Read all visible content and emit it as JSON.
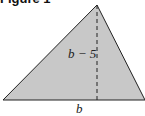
{
  "figure": {
    "title": "Figure 1",
    "shape": "triangle",
    "fill_color": "#c8c8c8",
    "stroke_color": "#222222",
    "height_label": "b − 5",
    "base_label": "b",
    "vertices": {
      "apex": [
        97,
        5
      ],
      "base_left": [
        3,
        100
      ],
      "base_right": [
        145,
        100
      ]
    },
    "altitude": {
      "x": 97,
      "y_top": 5,
      "y_bottom": 100,
      "style": "dashed"
    }
  }
}
